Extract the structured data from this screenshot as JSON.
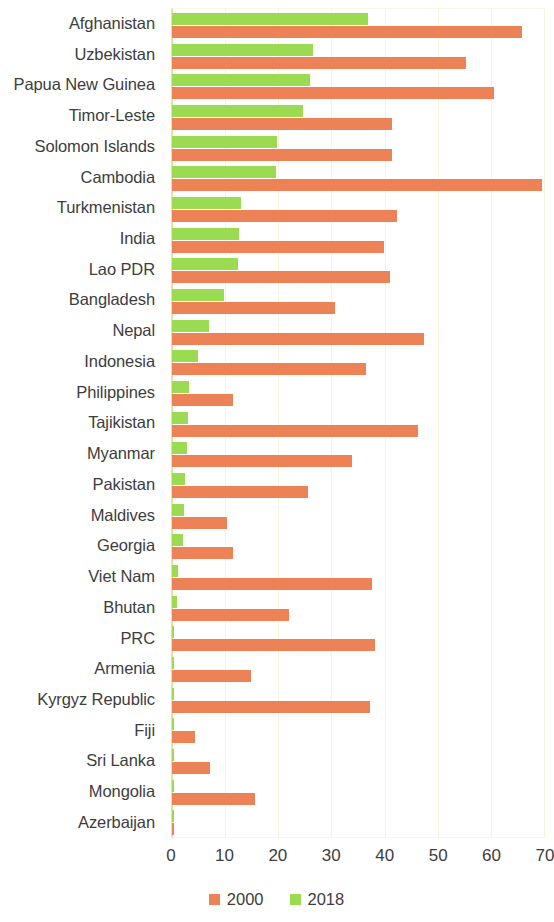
{
  "chart_data": {
    "type": "bar",
    "orientation": "horizontal",
    "title": "",
    "subtitle": "",
    "xlabel": "",
    "ylabel": "",
    "xlim": [
      0,
      70
    ],
    "xticks": [
      0,
      10,
      20,
      30,
      40,
      50,
      60,
      70
    ],
    "xtick_labels": [
      "0",
      "10",
      "20",
      "30",
      "40",
      "50",
      "60",
      "70"
    ],
    "grid": true,
    "grid_axis": "x",
    "legend_position": "bottom",
    "categories": [
      "Afghanistan",
      "Uzbekistan",
      "Papua New Guinea",
      "Timor-Leste",
      "Solomon Islands",
      "Cambodia",
      "Turkmenistan",
      "India",
      "Lao PDR",
      "Bangladesh",
      "Nepal",
      "Indonesia",
      "Philippines",
      "Tajikistan",
      "Myanmar",
      "Pakistan",
      "Maldives",
      "Georgia",
      "Viet Nam",
      "Bhutan",
      "PRC",
      "Armenia",
      "Kyrgyz Republic",
      "Fiji",
      "Sri Lanka",
      "Mongolia",
      "Azerbaijan"
    ],
    "series": [
      {
        "name": "2000",
        "color": "#ee8257",
        "values": [
          65.8,
          55.4,
          60.5,
          41.4,
          41.4,
          69.6,
          42.4,
          39.9,
          41.1,
          30.6,
          47.5,
          36.5,
          11.5,
          46.2,
          33.8,
          25.6,
          10.3,
          11.5,
          37.7,
          22.1,
          38.2,
          14.8,
          37.3,
          4.4,
          7.1,
          15.6,
          0.3
        ]
      },
      {
        "name": "2018",
        "color": "#9bdb52",
        "values": [
          36.9,
          26.6,
          26.0,
          24.7,
          19.8,
          19.6,
          12.9,
          12.7,
          12.4,
          9.7,
          6.9,
          4.9,
          3.2,
          3.0,
          2.9,
          2.5,
          2.2,
          2.0,
          1.2,
          0.9,
          0.4,
          0.3,
          0.3,
          0.3,
          0.3,
          0.3,
          0.3
        ]
      }
    ]
  },
  "legend": {
    "items": [
      {
        "label": "2000",
        "color": "#ee8257"
      },
      {
        "label": "2018",
        "color": "#9bdb52"
      }
    ]
  }
}
